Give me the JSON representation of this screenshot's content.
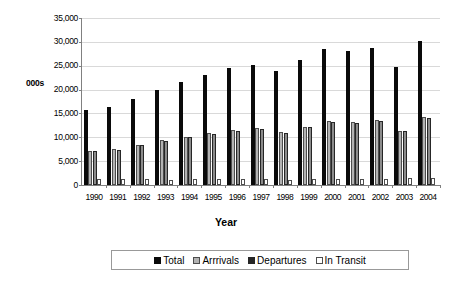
{
  "chart_data": {
    "type": "bar",
    "title": "",
    "xlabel": "Year",
    "ylabel": "000s",
    "ylim": [
      0,
      35000
    ],
    "ytick_labels": [
      "35,000",
      "30,000",
      "25,000",
      "20,000",
      "15,000",
      "10,000",
      "5,000",
      "0"
    ],
    "ytick_values": [
      35000,
      30000,
      25000,
      20000,
      15000,
      10000,
      5000,
      0
    ],
    "grid": true,
    "legend_position": "bottom",
    "categories": [
      "1990",
      "1991",
      "1992",
      "1993",
      "1994",
      "1995",
      "1996",
      "1997",
      "1998",
      "1999",
      "2000",
      "2001",
      "2002",
      "2003",
      "2004"
    ],
    "series": [
      {
        "name": "Total",
        "color": "#0a0a0a",
        "values": [
          15700,
          16400,
          18100,
          19900,
          21500,
          23000,
          24600,
          25200,
          23800,
          26100,
          28500,
          28000,
          28800,
          24700,
          30200
        ]
      },
      {
        "name": "Arrrivals",
        "color": "#b3b3b3",
        "values": [
          7200,
          7600,
          8400,
          9400,
          10100,
          10800,
          11500,
          11900,
          11200,
          12200,
          13400,
          13300,
          13600,
          11400,
          14200
        ]
      },
      {
        "name": "Departures",
        "color": "#8c8c8c",
        "values": [
          7100,
          7400,
          8300,
          9200,
          10000,
          10700,
          11400,
          11700,
          11000,
          12100,
          13300,
          13100,
          13500,
          11300,
          14000
        ]
      },
      {
        "name": "In Transit",
        "color": "#ffffff",
        "values": [
          1300,
          1200,
          1200,
          1150,
          1300,
          1300,
          1250,
          1250,
          1100,
          1350,
          1350,
          1350,
          1350,
          1400,
          1500
        ]
      }
    ]
  },
  "legend": {
    "items": [
      {
        "label": "Total",
        "swatch": "sw-total"
      },
      {
        "label": "Arrrivals",
        "swatch": "sw-arrivals"
      },
      {
        "label": "Departures",
        "swatch": "sw-departures"
      },
      {
        "label": "In Transit",
        "swatch": "sw-intransit"
      }
    ]
  }
}
